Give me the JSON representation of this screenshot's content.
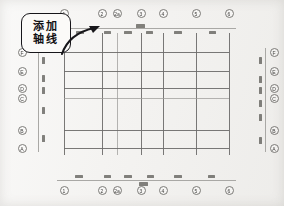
{
  "document": {
    "title": "建筑轴线网格",
    "type": "cad-axis-grid-drawing",
    "background_color": "#f2f1ef",
    "line_color": "#6e6d6b",
    "dimension_line_color": "#a9a8a5"
  },
  "callout": {
    "name": "add-axis-lines-callout",
    "line1": "添加",
    "line2": "轴线",
    "full_text": "添加轴线",
    "border_color": "#17161a",
    "fill_color": "#fbfaf8",
    "arrow": "curved-arrow-pointing-right"
  },
  "axes": {
    "vertical_labels_top": [
      {
        "label": "1",
        "x": 64
      },
      {
        "label": "2",
        "x": 102
      },
      {
        "label": "2a",
        "x": 117
      },
      {
        "label": "3",
        "x": 141
      },
      {
        "label": "4",
        "x": 163
      },
      {
        "label": "5",
        "x": 196
      },
      {
        "label": "6",
        "x": 229
      }
    ],
    "vertical_labels_bottom": [
      {
        "label": "1",
        "x": 64
      },
      {
        "label": "2",
        "x": 102
      },
      {
        "label": "2a",
        "x": 117
      },
      {
        "label": "3",
        "x": 141
      },
      {
        "label": "4",
        "x": 163
      },
      {
        "label": "5",
        "x": 196
      },
      {
        "label": "6",
        "x": 229
      }
    ],
    "horizontal_labels_left": [
      {
        "label": "F",
        "y": 52
      },
      {
        "label": "E",
        "y": 71
      },
      {
        "label": "D",
        "y": 88
      },
      {
        "label": "C",
        "y": 98
      },
      {
        "label": "B",
        "y": 130
      },
      {
        "label": "A",
        "y": 148
      }
    ],
    "horizontal_labels_right": [
      {
        "label": "F",
        "y": 52
      },
      {
        "label": "E",
        "y": 71
      },
      {
        "label": "D",
        "y": 88
      },
      {
        "label": "C",
        "y": 98
      },
      {
        "label": "B",
        "y": 130
      },
      {
        "label": "A",
        "y": 148
      }
    ]
  },
  "grid": {
    "vertical_lines_x": [
      64,
      102,
      117,
      141,
      163,
      196,
      229
    ],
    "horizontal_lines_y": [
      52,
      71,
      88,
      98,
      130,
      148
    ],
    "top": 33,
    "bottom": 155,
    "left": 64,
    "right": 229
  },
  "dimension_strings": {
    "top": {
      "line_y": 28,
      "start_x": 64,
      "end_x": 236,
      "segments_x": [
        80,
        107,
        128,
        149,
        178,
        212
      ],
      "stacked_segment_x": 140
    },
    "bottom": {
      "line_y": 180,
      "start_x": 57,
      "end_x": 236,
      "segments_x": [
        79,
        107,
        128,
        150,
        178,
        211
      ],
      "stacked_segment_x": 143
    },
    "left": {
      "line_x": 38,
      "start_y": 48,
      "end_y": 152,
      "segments_y": [
        60,
        78,
        90,
        110,
        138
      ]
    },
    "right": {
      "line_x": 265,
      "start_y": 48,
      "end_y": 152,
      "segments_y": [
        60,
        79,
        90,
        103,
        117,
        140
      ]
    }
  }
}
